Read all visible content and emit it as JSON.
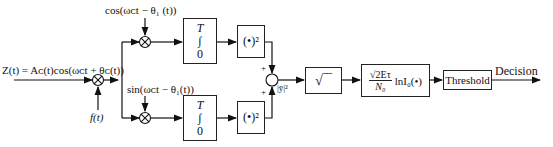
{
  "diagram": {
    "input_signal_label": "Z(t) = A_c(t)cos(ω_c t + θ_c(t))",
    "input_signal_display": "Z(t) = Aᴄ(t)cos(ωᴄt + θᴄ(t))",
    "reference_input_label": "f(t)",
    "top_branch": {
      "carrier_label": "cos(ωᴄt − θ₁ (t))",
      "integrator": {
        "upper_limit": "T",
        "symbol": "∫",
        "lower_limit": "0"
      },
      "squarer_label": "(•)²",
      "sum_sign": "+"
    },
    "bottom_branch": {
      "carrier_label": "sin(ωᴄt − θ₁(t))",
      "integrator": {
        "upper_limit": "T",
        "symbol": "∫",
        "lower_limit": "0"
      },
      "squarer_label": "(•)²",
      "sum_sign": "+"
    },
    "summer_output_label": "|ȳ|²",
    "sqrt_block_label": "√‾‾",
    "bessel_block": {
      "numerator": "√2Eτ",
      "denominator": "N₀",
      "function": "lnI₀(•)"
    },
    "threshold_block_label": "Threshold",
    "output_label": "Decision"
  }
}
